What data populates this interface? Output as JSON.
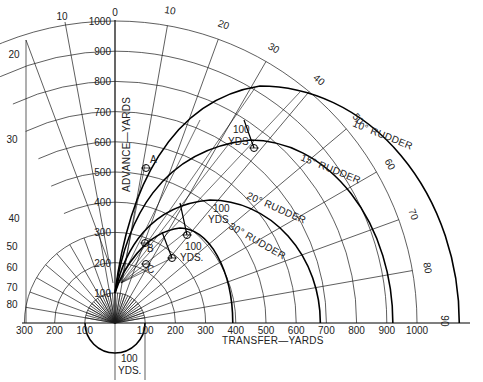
{
  "diagram": {
    "axes": {
      "y_label": "ADVANCE—YARDS",
      "x_label": "TRANSFER—YARDS",
      "y_ticks": [
        "100",
        "200",
        "300",
        "400",
        "500",
        "600",
        "700",
        "800",
        "900",
        "1000"
      ],
      "x_ticks_right": [
        "100",
        "200",
        "300",
        "400",
        "500",
        "600",
        "700",
        "800",
        "900",
        "1000"
      ],
      "x_ticks_left": [
        "100",
        "200",
        "300"
      ],
      "bearing_right": [
        "0",
        "10",
        "20",
        "30",
        "40",
        "50",
        "60",
        "70",
        "80",
        "90"
      ],
      "bearing_left": [
        "10",
        "20",
        "30",
        "40",
        "50",
        "60",
        "70",
        "80"
      ]
    },
    "rudder_curves": [
      {
        "label": "10° RUDDER",
        "final_transfer_yards": 1140
      },
      {
        "label": "15° RUDDER",
        "final_transfer_yards": 920
      },
      {
        "label": "20° RUDDER",
        "final_transfer_yards": 680
      },
      {
        "label": "30° RUDDER",
        "final_transfer_yards": 390
      }
    ],
    "points": [
      {
        "label": "A"
      },
      {
        "label": "B"
      },
      {
        "label": "C"
      }
    ],
    "annotations": {
      "yds_100": "100",
      "yds": "YDS.",
      "yds_plain": "YDS",
      "scale_100": "100",
      "scale_yds": "YDS."
    }
  }
}
